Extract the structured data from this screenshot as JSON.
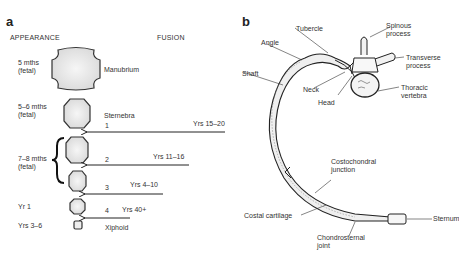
{
  "panel_a": {
    "letter": "a",
    "headers": {
      "appearance": "APPEARANCE",
      "fusion": "FUSION"
    },
    "appearance_times": [
      {
        "line1": "5 mths",
        "line2": "(fetal)"
      },
      {
        "line1": "5–6 mths",
        "line2": "(fetal)"
      },
      {
        "line1": "7–8 mths",
        "line2": "(fetal)"
      },
      {
        "line1": "Yr 1",
        "line2": ""
      },
      {
        "line1": "Yrs 3–6",
        "line2": ""
      }
    ],
    "segments": [
      {
        "name": "Manubrium"
      },
      {
        "name": "Sternebra",
        "number": "1"
      },
      {
        "number": "2"
      },
      {
        "number": "3"
      },
      {
        "number": "4"
      },
      {
        "name": "Xiphoid"
      }
    ],
    "fusion_times": [
      "Yrs 15–20",
      "Yrs 11–16",
      "Yrs 4–10",
      "Yrs 40+"
    ]
  },
  "panel_b": {
    "letter": "b",
    "labels": {
      "tubercle": "Tubercle",
      "spinous": [
        "Spinous",
        "process"
      ],
      "angle": "Angle",
      "transverse": [
        "Transverse",
        "process"
      ],
      "shaft": "Shaft",
      "neck": "Neck",
      "thoracic": [
        "Thoracic",
        "vertebra"
      ],
      "head": "Head",
      "costochondral": [
        "Costochondral",
        "junction"
      ],
      "costal_cartilage": "Costal cartilage",
      "sternum": "Sternum",
      "chondrosternal": [
        "Chondrosternal",
        "joint"
      ]
    }
  }
}
